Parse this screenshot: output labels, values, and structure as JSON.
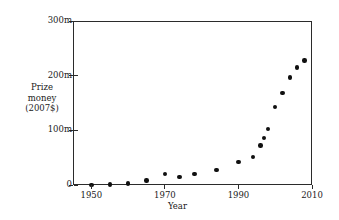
{
  "chart_data": {
    "type": "scatter",
    "title": "",
    "xlabel": "Year",
    "ylabel_lines": [
      "Prize",
      "money",
      "(2007$)"
    ],
    "ylabel": "Prize money (2007$)",
    "xlim": [
      1945,
      2010
    ],
    "ylim": [
      0,
      300
    ],
    "xticks": [
      1950,
      1970,
      1990,
      2010
    ],
    "xtick_labels": [
      "1950",
      "1970",
      "1990",
      "2010"
    ],
    "yticks": [
      0,
      100,
      200,
      300
    ],
    "ytick_labels": [
      "0",
      "100m",
      "200m",
      "300m"
    ],
    "grid": false,
    "legend": null,
    "marker_color": "#101010",
    "axis_color": "#2b2b2b",
    "x": [
      1950,
      1955,
      1960,
      1965,
      1970,
      1974,
      1978,
      1984,
      1990,
      1994,
      1996,
      1997,
      1998,
      2000,
      2002,
      2004,
      2006,
      2008
    ],
    "y": [
      0,
      1,
      3,
      8,
      20,
      15,
      20,
      27,
      42,
      51,
      72,
      86,
      103,
      143,
      168,
      197,
      215,
      228
    ],
    "points": [
      {
        "x": 1950,
        "y": 0
      },
      {
        "x": 1955,
        "y": 1
      },
      {
        "x": 1960,
        "y": 3
      },
      {
        "x": 1965,
        "y": 8
      },
      {
        "x": 1970,
        "y": 20
      },
      {
        "x": 1974,
        "y": 15
      },
      {
        "x": 1978,
        "y": 20
      },
      {
        "x": 1984,
        "y": 27
      },
      {
        "x": 1990,
        "y": 42
      },
      {
        "x": 1994,
        "y": 51
      },
      {
        "x": 1996,
        "y": 72
      },
      {
        "x": 1997,
        "y": 86
      },
      {
        "x": 1998,
        "y": 103
      },
      {
        "x": 2000,
        "y": 143
      },
      {
        "x": 2002,
        "y": 168
      },
      {
        "x": 2004,
        "y": 197
      },
      {
        "x": 2006,
        "y": 215
      },
      {
        "x": 2008,
        "y": 228
      }
    ]
  }
}
